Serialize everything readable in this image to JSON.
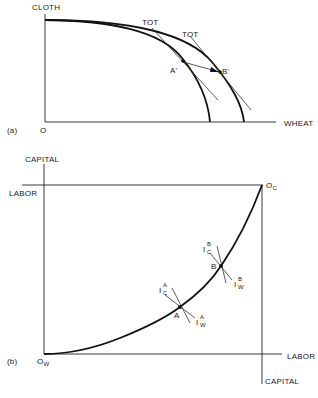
{
  "panel_a": {
    "tag": "(a)",
    "origin_label": "O",
    "y_axis_label": "CLOTH",
    "x_axis_label": "WHEAT",
    "tot_labels": [
      "TOT",
      "TOT"
    ],
    "point_labels": [
      "A'",
      "B'"
    ],
    "description": "Two production possibility frontiers (inner and outer) with terms-of-trade lines tangent at A' and B'; arrow from A' to B'"
  },
  "panel_b": {
    "tag": "(b)",
    "origin_wheat_label": "O",
    "origin_wheat_sub": "W",
    "origin_cloth_label": "O",
    "origin_cloth_sub": "C",
    "left_top_axis_label": "CAPITAL",
    "left_side_axis_label": "LABOR",
    "bottom_right_axis_label": "LABOR",
    "right_bottom_axis_label": "CAPITAL",
    "points": [
      {
        "label": "A",
        "isoquant_c": {
          "base": "I",
          "sup": "A",
          "sub": "C"
        },
        "isoquant_w": {
          "base": "I",
          "sup": "A",
          "sub": "W"
        }
      },
      {
        "label": "B",
        "isoquant_c": {
          "base": "I",
          "sup": "B",
          "sub": "C"
        },
        "isoquant_w": {
          "base": "I",
          "sup": "B",
          "sub": "W"
        }
      }
    ],
    "description": "Edgeworth box contract curve from O_W to O_C with tangency points A and B"
  }
}
